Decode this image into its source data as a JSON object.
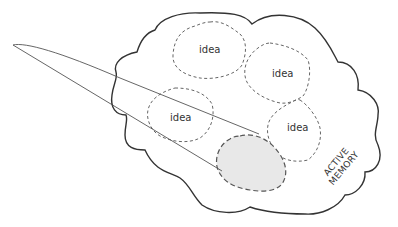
{
  "diagram": {
    "type": "conceptual-illustration",
    "cloud_label": "ACTIVE MEMORY",
    "cloud_label_lines": [
      "ACTIVE",
      "MEMORY"
    ],
    "ideas": [
      {
        "label": "idea"
      },
      {
        "label": "idea"
      },
      {
        "label": "idea"
      },
      {
        "label": "idea"
      }
    ],
    "focus_region": {
      "label": ""
    },
    "colors": {
      "cloud_stroke": "#333333",
      "idea_stroke": "#666666",
      "beam_stroke": "#555555",
      "focus_fill": "#e8e8e8",
      "focus_stroke": "#555555",
      "text": "#333333"
    }
  }
}
